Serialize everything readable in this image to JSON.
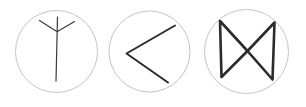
{
  "canvas": {
    "width": 306,
    "height": 107,
    "background_color": "#ffffff",
    "description": "Three hand-drawn symbols, each enclosed in a thin circle outline"
  },
  "style": {
    "circle_stroke_color": "#b5b5b5",
    "circle_stroke_width": 0.8,
    "glyph_stroke_color": "#3a3a3a",
    "glyph_stroke_dark_color": "#2b2b2b",
    "glyph_stroke_width_thin": 1.1,
    "glyph_stroke_width_thick": 2.6
  },
  "symbols": [
    {
      "id": "symbol-1",
      "name": "y-rune-symbol",
      "label": "Y rune",
      "circle": {
        "cx": 56.5,
        "cy": 51.5,
        "r": 41.0
      },
      "strokes": [
        {
          "name": "vertical-stem",
          "type": "line",
          "x1": 57.5,
          "y1": 17.0,
          "x2": 56.0,
          "y2": 81.0,
          "width": 1.2
        },
        {
          "name": "left-arm",
          "type": "line",
          "x1": 39.5,
          "y1": 20.5,
          "x2": 56.8,
          "y2": 31.5,
          "width": 1.2
        },
        {
          "name": "right-arm",
          "type": "line",
          "x1": 74.5,
          "y1": 21.5,
          "x2": 57.5,
          "y2": 31.5,
          "width": 1.2
        }
      ]
    },
    {
      "id": "symbol-2",
      "name": "left-chevron-symbol",
      "label": "Left chevron",
      "circle": {
        "cx": 149.5,
        "cy": 51.5,
        "r": 40.5
      },
      "strokes": [
        {
          "name": "upper-arm",
          "type": "line",
          "x1": 175.0,
          "y1": 25.5,
          "x2": 126.5,
          "y2": 53.5,
          "width": 2.0
        },
        {
          "name": "lower-arm",
          "type": "line",
          "x1": 126.5,
          "y1": 53.5,
          "x2": 168.0,
          "y2": 82.5,
          "width": 2.0
        }
      ]
    },
    {
      "id": "symbol-3",
      "name": "bowtie-symbol",
      "label": "Bowtie",
      "circle": {
        "cx": 246.5,
        "cy": 51.5,
        "r": 42.0
      },
      "strokes": [
        {
          "name": "left-vertical-edge",
          "type": "line",
          "x1": 220.0,
          "y1": 21.0,
          "x2": 221.5,
          "y2": 77.0,
          "width": 2.6
        },
        {
          "name": "right-vertical-edge",
          "type": "line",
          "x1": 274.5,
          "y1": 22.5,
          "x2": 272.5,
          "y2": 79.5,
          "width": 2.6
        },
        {
          "name": "top-left-diagonal",
          "type": "line",
          "x1": 220.0,
          "y1": 21.0,
          "x2": 247.5,
          "y2": 51.0,
          "width": 2.6
        },
        {
          "name": "top-right-diagonal",
          "type": "line",
          "x1": 274.5,
          "y1": 22.5,
          "x2": 247.5,
          "y2": 51.0,
          "width": 2.6
        },
        {
          "name": "bottom-left-diagonal",
          "type": "line",
          "x1": 221.5,
          "y1": 77.0,
          "x2": 247.5,
          "y2": 51.0,
          "width": 2.6
        },
        {
          "name": "bottom-right-diagonal",
          "type": "line",
          "x1": 272.5,
          "y1": 79.5,
          "x2": 247.5,
          "y2": 51.0,
          "width": 2.6
        }
      ]
    }
  ]
}
